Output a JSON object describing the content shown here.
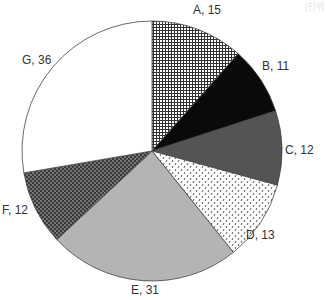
{
  "unit_label": "(단위",
  "chart_data": {
    "type": "pie",
    "title": "",
    "start_angle_deg": 0,
    "direction": "clockwise",
    "categories": [
      "A",
      "B",
      "C",
      "D",
      "E",
      "F",
      "G"
    ],
    "values": [
      15,
      11,
      12,
      13,
      31,
      12,
      36
    ],
    "total": 130,
    "labels": [
      "A, 15",
      "B, 11",
      "C, 12",
      "D, 13",
      "E, 31",
      "F, 12",
      "G, 36"
    ],
    "fills": [
      "grid-hatch",
      "solid-black",
      "solid-dark-gray",
      "dotted-light",
      "solid-light-gray",
      "dense-dots-dark",
      "white"
    ],
    "legend": "none"
  }
}
